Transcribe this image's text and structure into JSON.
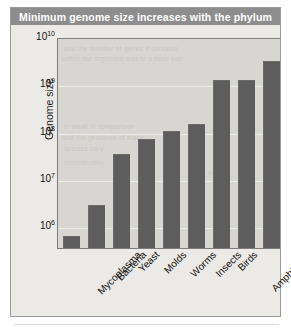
{
  "figure": {
    "title": "Minimum genome size increases with the phylum",
    "title_bar_color": "#8d8d8d",
    "title_text_color": "#ffffff",
    "panel_background": "#eceae6",
    "plot_background": "#d8d6d2",
    "bar_color": "#5d5d5d",
    "border_color": "#9a9a9a"
  },
  "axes": {
    "y_axis_label": "Genome size",
    "y_ticks": [
      {
        "label": "10",
        "exponent": "10",
        "value": 10000000000
      },
      {
        "label": "10",
        "exponent": "9",
        "value": 1000000000
      },
      {
        "label": "10",
        "exponent": "8",
        "value": 100000000
      },
      {
        "label": "10",
        "exponent": "7",
        "value": 10000000
      },
      {
        "label": "10",
        "exponent": "6",
        "value": 1000000
      }
    ],
    "x_axis_label": ""
  },
  "ghost_text": [
    {
      "text": "and the number of genes it contains",
      "x": 6,
      "y": 6
    },
    {
      "text": "within the organism was in a base pair",
      "x": 4,
      "y": 16
    },
    {
      "text": "is small in comparison",
      "x": 6,
      "y": 84
    },
    {
      "text": "and the genomes of many",
      "x": 4,
      "y": 95
    },
    {
      "text": "species vary",
      "x": 6,
      "y": 106
    },
    {
      "text": "considerably",
      "x": 6,
      "y": 120
    },
    {
      "text": "in size",
      "x": 150,
      "y": 130
    }
  ],
  "chart_data": {
    "type": "bar",
    "title": "Minimum genome size increases with the phylum",
    "xlabel": "",
    "ylabel": "Genome size",
    "yscale": "log",
    "ylim": [
      300000,
      10000000000
    ],
    "grid": true,
    "legend": false,
    "categories": [
      "Mycoplasma",
      "Bacteria",
      "Yeast",
      "Molds",
      "Worms",
      "Insects",
      "Birds",
      "Amphibians",
      "Mammals"
    ],
    "values": [
      600000,
      2700000,
      32000000,
      68000000,
      100000000,
      140000000,
      1200000000,
      1200000000,
      3000000000
    ],
    "value_labels": [
      "6 x 10^5",
      "2.7 x 10^6",
      "3.2 x 10^7",
      "6.8 x 10^7",
      "1 x 10^8",
      "1.4 x 10^8",
      "1.2 x 10^9",
      "1.2 x 10^9",
      "3 x 10^9"
    ]
  }
}
